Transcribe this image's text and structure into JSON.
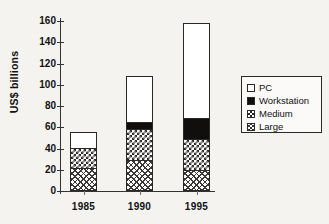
{
  "chart_data": {
    "type": "bar",
    "stacked": true,
    "title": "",
    "xlabel": "",
    "ylabel": "US$ billions",
    "categories": [
      "1985",
      "1990",
      "1995"
    ],
    "yticks": [
      0,
      20,
      40,
      60,
      80,
      100,
      120,
      140,
      160
    ],
    "ylim": [
      0,
      160
    ],
    "grid": false,
    "legend_position": "right",
    "series": [
      {
        "name": "Large",
        "swatch": "diagonal-crosshatch",
        "values": [
          21,
          28,
          19
        ]
      },
      {
        "name": "Medium",
        "swatch": "checkerboard",
        "values": [
          19,
          29,
          29
        ]
      },
      {
        "name": "Workstation",
        "swatch": "solid-black",
        "values": [
          0,
          7,
          20
        ]
      },
      {
        "name": "PC",
        "swatch": "white",
        "values": [
          15,
          43,
          89
        ]
      }
    ],
    "totals": [
      55,
      107,
      157
    ],
    "legend_order": [
      "PC",
      "Workstation",
      "Medium",
      "Large"
    ]
  },
  "axis": {
    "y_title": "US$ billions",
    "tick_labels": [
      "160",
      "140",
      "120",
      "100",
      "80",
      "60",
      "40",
      "20",
      "0"
    ],
    "x_labels": [
      "1985",
      "1990",
      "1995"
    ]
  },
  "legend": {
    "items": [
      {
        "label": "PC"
      },
      {
        "label": "Workstation"
      },
      {
        "label": "Medium"
      },
      {
        "label": "Large"
      }
    ]
  },
  "colors": {
    "ink": "#2b2926",
    "background": "#f4f3f0",
    "workstation_fill": "#100f0e",
    "pc_fill": "#ffffff"
  }
}
